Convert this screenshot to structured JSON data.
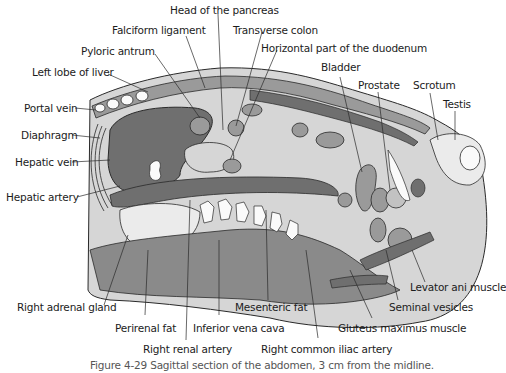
{
  "figure": {
    "caption": "Figure 4-29  Sagittal section of the abdomen, 3 cm from the midline.",
    "colors": {
      "background": "#ffffff",
      "dark_organ": "#6f6f6f",
      "mid_tissue": "#9a9a9a",
      "light_tissue": "#d6d6d6",
      "pale": "#ebebeb",
      "white": "#fafafa",
      "line": "#2a2a2a"
    },
    "labels": {
      "head_of_pancreas": "Head of the pancreas",
      "falciform_ligament": "Falciform ligament",
      "transverse_colon": "Transverse colon",
      "pyloric_antrum": "Pyloric antrum",
      "horizontal_duodenum": "Horizontal part of the duodenum",
      "left_lobe_liver": "Left lobe of liver",
      "bladder": "Bladder",
      "prostate": "Prostate",
      "scrotum": "Scrotum",
      "testis": "Testis",
      "portal_vein": "Portal vein",
      "diaphragm": "Diaphragm",
      "hepatic_vein": "Hepatic vein",
      "hepatic_artery": "Hepatic artery",
      "right_adrenal_gland": "Right adrenal gland",
      "perirenal_fat": "Perirenal fat",
      "inferior_vena_cava": "Inferior vena cava",
      "mesenteric_fat": "Mesenteric fat",
      "right_renal_artery": "Right renal artery",
      "right_common_iliac_artery": "Right common iliac artery",
      "gluteus_maximus": "Gluteus maximus muscle",
      "seminal_vesicles": "Seminal vesicles",
      "levator_ani": "Levator ani muscle"
    }
  }
}
